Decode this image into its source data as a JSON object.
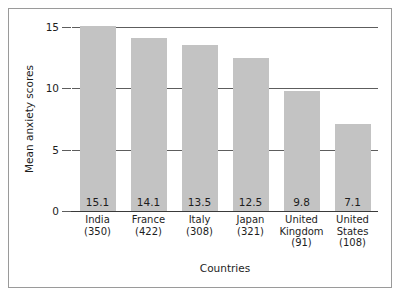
{
  "chart_data": {
    "type": "bar",
    "title": "",
    "xlabel": "Countries",
    "ylabel": "Mean anxiety scores",
    "categories": [
      "India",
      "France",
      "Italy",
      "Japan",
      "United Kingdom",
      "United States"
    ],
    "category_lines": [
      [
        "India",
        "(350)"
      ],
      [
        "France",
        "(422)"
      ],
      [
        "Italy",
        "(308)"
      ],
      [
        "Japan",
        "(321)"
      ],
      [
        "United",
        "Kingdom",
        "(91)"
      ],
      [
        "United",
        "States",
        "(108)"
      ]
    ],
    "sample_sizes": [
      350,
      422,
      308,
      321,
      91,
      108
    ],
    "values": [
      15.1,
      14.1,
      13.5,
      12.5,
      9.8,
      7.1
    ],
    "value_labels": [
      "15.1",
      "14.1",
      "13.5",
      "12.5",
      "9.8",
      "7.1"
    ],
    "ylim": [
      0,
      15
    ],
    "yticks": [
      0,
      5,
      10,
      15
    ],
    "ytick_labels": [
      "0",
      "5",
      "10",
      "15"
    ],
    "grid": true,
    "grid_axis": "y",
    "legend": false,
    "bar_color": "#c3c3c3",
    "axis_color": "#5d5d5d",
    "text_color": "#1d1d1d",
    "frame_color": "#9a9a9a",
    "background": "#ffffff"
  }
}
